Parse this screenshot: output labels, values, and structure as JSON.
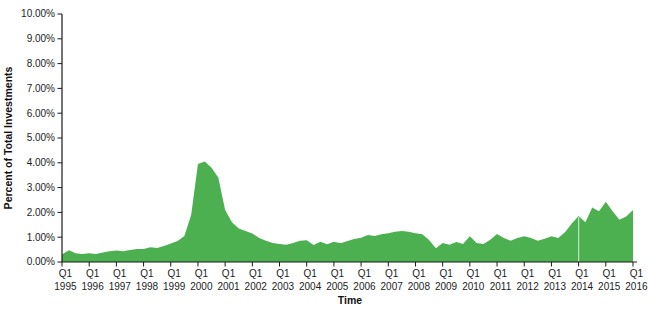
{
  "chart_data": {
    "type": "area",
    "title": "",
    "xlabel": "Time",
    "ylabel": "Percent of Total Investments",
    "ylim": [
      0,
      10
    ],
    "y_tick_step_percent": 1,
    "y_tick_labels": [
      "0.00%",
      "1.00%",
      "2.00%",
      "3.00%",
      "4.00%",
      "5.00%",
      "6.00%",
      "7.00%",
      "8.00%",
      "9.00%",
      "10.00%"
    ],
    "x_tick_quarter_label": "Q1",
    "x_tick_years": [
      "1995",
      "1996",
      "1997",
      "1998",
      "1999",
      "2000",
      "2001",
      "2002",
      "2003",
      "2004",
      "2005",
      "2006",
      "2007",
      "2008",
      "2009",
      "2010",
      "2011",
      "2012",
      "2013",
      "2014",
      "2015",
      "2016"
    ],
    "x_frequency": "quarterly",
    "grid": "off",
    "legend": "none",
    "fill_color": "#4cb050",
    "background_color": "#ffffff",
    "gap_marker": {
      "at": "2014 Q1",
      "color": "#b5e2b6"
    },
    "categories": [
      "1995 Q1",
      "1995 Q2",
      "1995 Q3",
      "1995 Q4",
      "1996 Q1",
      "1996 Q2",
      "1996 Q3",
      "1996 Q4",
      "1997 Q1",
      "1997 Q2",
      "1997 Q3",
      "1997 Q4",
      "1998 Q1",
      "1998 Q2",
      "1998 Q3",
      "1998 Q4",
      "1999 Q1",
      "1999 Q2",
      "1999 Q3",
      "1999 Q4",
      "2000 Q1",
      "2000 Q2",
      "2000 Q3",
      "2000 Q4",
      "2001 Q1",
      "2001 Q2",
      "2001 Q3",
      "2001 Q4",
      "2002 Q1",
      "2002 Q2",
      "2002 Q3",
      "2002 Q4",
      "2003 Q1",
      "2003 Q2",
      "2003 Q3",
      "2003 Q4",
      "2004 Q1",
      "2004 Q2",
      "2004 Q3",
      "2004 Q4",
      "2005 Q1",
      "2005 Q2",
      "2005 Q3",
      "2005 Q4",
      "2006 Q1",
      "2006 Q2",
      "2006 Q3",
      "2006 Q4",
      "2007 Q1",
      "2007 Q2",
      "2007 Q3",
      "2007 Q4",
      "2008 Q1",
      "2008 Q2",
      "2008 Q3",
      "2008 Q4",
      "2009 Q1",
      "2009 Q2",
      "2009 Q3",
      "2009 Q4",
      "2010 Q1",
      "2010 Q2",
      "2010 Q3",
      "2010 Q4",
      "2011 Q1",
      "2011 Q2",
      "2011 Q3",
      "2011 Q4",
      "2012 Q1",
      "2012 Q2",
      "2012 Q3",
      "2012 Q4",
      "2013 Q1",
      "2013 Q2",
      "2013 Q3",
      "2013 Q4",
      "2014 Q1",
      "2014 Q2",
      "2014 Q3",
      "2014 Q4",
      "2015 Q1",
      "2015 Q2",
      "2015 Q3",
      "2015 Q4",
      "2016 Q1"
    ],
    "values": [
      0.3,
      0.47,
      0.35,
      0.32,
      0.35,
      0.32,
      0.38,
      0.43,
      0.46,
      0.43,
      0.48,
      0.52,
      0.52,
      0.59,
      0.56,
      0.65,
      0.75,
      0.85,
      1.05,
      1.9,
      3.95,
      4.05,
      3.8,
      3.4,
      2.1,
      1.6,
      1.35,
      1.25,
      1.15,
      0.97,
      0.86,
      0.77,
      0.73,
      0.7,
      0.77,
      0.86,
      0.88,
      0.69,
      0.82,
      0.72,
      0.82,
      0.76,
      0.85,
      0.93,
      0.98,
      1.09,
      1.05,
      1.12,
      1.16,
      1.22,
      1.25,
      1.22,
      1.16,
      1.12,
      0.89,
      0.55,
      0.77,
      0.7,
      0.81,
      0.73,
      1.04,
      0.77,
      0.73,
      0.9,
      1.13,
      0.97,
      0.86,
      0.97,
      1.04,
      0.97,
      0.86,
      0.94,
      1.04,
      0.97,
      1.2,
      1.55,
      1.85,
      1.6,
      2.2,
      2.05,
      2.43,
      2.05,
      1.7,
      1.83,
      2.1
    ]
  }
}
